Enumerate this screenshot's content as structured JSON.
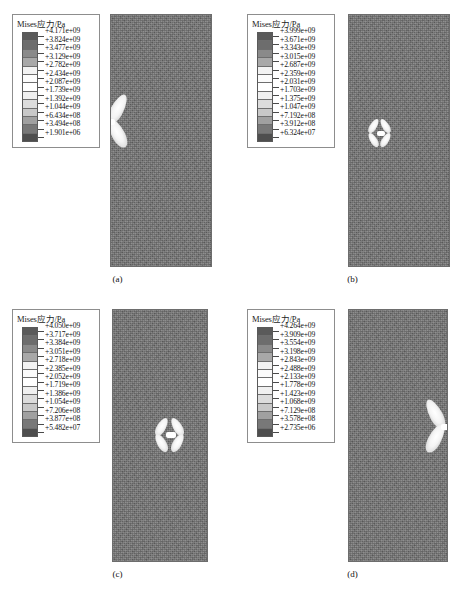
{
  "figure": {
    "legend_title": "Mises应力/Pa",
    "caption_a": "(a)",
    "caption_b": "(b)",
    "caption_c": "(c)",
    "caption_d": "(d)"
  },
  "chart_data": {
    "type": "heatmap",
    "title": "Mises应力/Pa",
    "xlabel": "",
    "ylabel": "",
    "grid": false,
    "legend_position": "left",
    "panels": [
      {
        "id": "a",
        "caption": "(a)",
        "legend_title": "Mises应力/Pa",
        "units": "Pa",
        "max_value": "+4.171e+09",
        "min_value": "+1.901e+06",
        "levels": [
          "+4.171e+09",
          "+3.824e+09",
          "+3.477e+09",
          "+3.129e+09",
          "+2.782e+09",
          "+2.434e+09",
          "+2.087e+09",
          "+1.739e+09",
          "+1.392e+09",
          "+1.044e+09",
          "+6.434e+08",
          "+3.494e+08",
          "+1.901e+06"
        ],
        "feature": "half bow-tie stress concentration on left edge, upper-middle"
      },
      {
        "id": "b",
        "caption": "(b)",
        "legend_title": "Mises应力/Pa",
        "units": "Pa",
        "max_value": "+3.999e+09",
        "min_value": "+6.324e+07",
        "levels": [
          "+3.999e+09",
          "+3.671e+09",
          "+3.343e+09",
          "+3.015e+09",
          "+2.687e+09",
          "+2.359e+09",
          "+2.031e+09",
          "+1.703e+09",
          "+1.375e+09",
          "+1.047e+09",
          "+7.192e+08",
          "+3.912e+08",
          "+6.324e+07"
        ],
        "feature": "full four-lobe bow-tie stress concentration, left of centre"
      },
      {
        "id": "c",
        "caption": "(c)",
        "legend_title": "Mises应力/Pa",
        "units": "Pa",
        "max_value": "+4.050e+09",
        "min_value": "+5.482e+07",
        "levels": [
          "+4.050e+09",
          "+3.717e+09",
          "+3.384e+09",
          "+3.051e+09",
          "+2.718e+09",
          "+2.385e+09",
          "+2.052e+09",
          "+1.719e+09",
          "+1.386e+09",
          "+1.054e+09",
          "+7.206e+08",
          "+3.877e+08",
          "+5.482e+07"
        ],
        "feature": "full four-lobe bow-tie stress concentration, right of centre"
      },
      {
        "id": "d",
        "caption": "(d)",
        "legend_title": "Mises应力/Pa",
        "units": "Pa",
        "max_value": "+4.264e+09",
        "min_value": "+2.735e+06",
        "levels": [
          "+4.264e+09",
          "+3.909e+09",
          "+3.554e+09",
          "+3.198e+09",
          "+2.843e+09",
          "+2.488e+09",
          "+2.133e+09",
          "+1.778e+09",
          "+1.423e+09",
          "+1.068e+09",
          "+7.129e+08",
          "+3.578e+08",
          "+2.735e+06"
        ],
        "feature": "half bow-tie stress concentration on right edge, middle"
      }
    ],
    "colorbar_bands": [
      "#5a5a5a",
      "#6d6d6d",
      "#8a8a8a",
      "#a8a8a8",
      "#f2f2f2",
      "#fbfbfb",
      "#ffffff",
      "#f0f0f0",
      "#dcdcdc",
      "#c8c8c8",
      "#a0a0a0",
      "#787878",
      "#4e4e4e"
    ]
  }
}
